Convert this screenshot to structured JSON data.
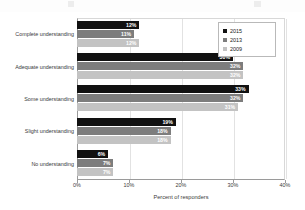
{
  "chart_data": {
    "type": "bar",
    "orientation": "horizontal",
    "title": "",
    "xlabel": "Percent of responders",
    "ylabel": "",
    "xlim": [
      0,
      40
    ],
    "xticks": [
      "0%",
      "10%",
      "20%",
      "30%",
      "40%"
    ],
    "xtick_values": [
      0,
      10,
      20,
      30,
      40
    ],
    "grid": true,
    "legend_position": "top-right",
    "categories": [
      "Complete understanding",
      "Adequate understanding",
      "Some understanding",
      "Slight understanding",
      "No understanding"
    ],
    "series": [
      {
        "name": "2015",
        "color": "#111111",
        "values": [
          12,
          30,
          33,
          19,
          6
        ],
        "labels": [
          "12%",
          "30%",
          "33%",
          "19%",
          "6%"
        ]
      },
      {
        "name": "2013",
        "color": "#7d7d7d",
        "values": [
          11,
          32,
          32,
          18,
          7
        ],
        "labels": [
          "11%",
          "32%",
          "32%",
          "18%",
          "7%"
        ]
      },
      {
        "name": "2009",
        "color": "#c3c3c3",
        "values": [
          12,
          32,
          31,
          18,
          7
        ],
        "labels": [
          "12%",
          "32%",
          "31%",
          "18%",
          "7%"
        ]
      }
    ]
  }
}
